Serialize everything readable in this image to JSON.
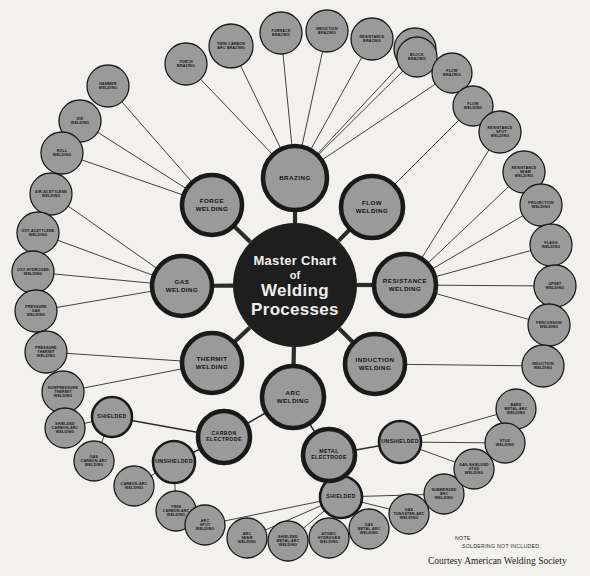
{
  "document": {
    "title_lines": [
      "Master Chart",
      "of",
      "Welding",
      "Processes"
    ],
    "note_label": "NOTE",
    "note_text": "SOLDERING NOT INCLUDED.",
    "courtesy": "Courtesy American Welding Society",
    "background_color": "#f2f1ee",
    "node_fill": "#9a9a9a",
    "node_stroke": "#1a1a1a",
    "center_fill": "#1e1e1e",
    "center_text_color": "#efefef"
  },
  "chart_data": {
    "type": "diagram",
    "layout": "radial hub-and-spoke",
    "center": "Master Chart of Welding Processes",
    "hubs": [
      {
        "id": "brazing",
        "label": "BRAZING",
        "x": 295,
        "y": 178,
        "r": 32,
        "leaves": [
          {
            "label": "TWIN CARBON ARC BRAZING",
            "x": 231,
            "y": 46,
            "r": 22
          },
          {
            "label": "FURNACE BRAZING",
            "x": 281,
            "y": 33,
            "r": 21
          },
          {
            "label": "INDUCTION BRAZING",
            "x": 327,
            "y": 31,
            "r": 21
          },
          {
            "label": "RESISTANCE BRAZING",
            "x": 372,
            "y": 39,
            "r": 21
          },
          {
            "label": "DIP BRAZING",
            "x": 415,
            "y": 49,
            "r": 21
          },
          {
            "label": "TORCH BRAZING",
            "x": 186,
            "y": 64,
            "r": 21
          },
          {
            "label": "BLOCK BRAZING",
            "x": 417,
            "y": 57,
            "r": 20
          },
          {
            "label": "FLOW BRAZING",
            "x": 452,
            "y": 73,
            "r": 20
          }
        ]
      },
      {
        "id": "forge",
        "label": "FORGE WELDING",
        "x": 212,
        "y": 205,
        "r": 30,
        "leaves": [
          {
            "label": "HAMMER WELDING",
            "x": 108,
            "y": 86,
            "r": 21
          },
          {
            "label": "DIE WELDING",
            "x": 80,
            "y": 121,
            "r": 21
          },
          {
            "label": "ROLL WELDING",
            "x": 62,
            "y": 153,
            "r": 21
          }
        ]
      },
      {
        "id": "gas",
        "label": "GAS WELDING",
        "x": 182,
        "y": 286,
        "r": 30,
        "leaves": [
          {
            "label": "AIR-ACETYLENE WELDING",
            "x": 51,
            "y": 194,
            "r": 21
          },
          {
            "label": "OXY-ACETYLENE WELDING",
            "x": 38,
            "y": 233,
            "r": 21
          },
          {
            "label": "OXY-HYDROGEN WELDING",
            "x": 33,
            "y": 272,
            "r": 21
          },
          {
            "label": "PRESSURE GAS WELDING",
            "x": 36,
            "y": 311,
            "r": 21
          }
        ]
      },
      {
        "id": "thermit",
        "label": "THERMIT WELDING",
        "x": 212,
        "y": 363,
        "r": 30,
        "leaves": [
          {
            "label": "PRESSURE THERMIT WELDING",
            "x": 46,
            "y": 352,
            "r": 21
          },
          {
            "label": "NONPRESSURE THERMIT WELDING",
            "x": 63,
            "y": 392,
            "r": 21
          }
        ]
      },
      {
        "id": "flow",
        "label": "FLOW WELDING",
        "x": 372,
        "y": 207,
        "r": 31,
        "leaves": [
          {
            "label": "FLOW WELDING",
            "x": 473,
            "y": 106,
            "r": 20
          }
        ]
      },
      {
        "id": "resistance",
        "label": "RESISTANCE WELDING",
        "x": 405,
        "y": 285,
        "r": 31,
        "leaves": [
          {
            "label": "RESISTANCE - SPOT WELDING",
            "x": 500,
            "y": 132,
            "r": 21
          },
          {
            "label": "RESISTANCE - SEAM WELDING",
            "x": 524,
            "y": 172,
            "r": 21
          },
          {
            "label": "PROJECTION WELDING",
            "x": 541,
            "y": 205,
            "r": 21
          },
          {
            "label": "FLASH WELDING",
            "x": 551,
            "y": 245,
            "r": 21
          },
          {
            "label": "UPSET WELDING",
            "x": 555,
            "y": 286,
            "r": 21
          },
          {
            "label": "PERCUSSION WELDING",
            "x": 549,
            "y": 325,
            "r": 21
          }
        ]
      },
      {
        "id": "induction",
        "label": "INDUCTION WELDING",
        "x": 375,
        "y": 364,
        "r": 30,
        "leaves": [
          {
            "label": "INDUCTION WELDING",
            "x": 543,
            "y": 366,
            "r": 21
          }
        ]
      },
      {
        "id": "arc",
        "label": "ARC WELDING",
        "x": 293,
        "y": 397,
        "r": 31,
        "leaves": []
      }
    ],
    "arc_branch": {
      "sub_hubs": [
        {
          "id": "carbon-electrode",
          "label": "CARBON ELECTRODE",
          "x": 224,
          "y": 437,
          "r": 26
        },
        {
          "id": "metal-electrode",
          "label": "METAL ELECTRODE",
          "x": 329,
          "y": 455,
          "r": 26
        }
      ],
      "groups": [
        {
          "id": "carbon-shielded",
          "label": "SHIELDED",
          "x": 112,
          "y": 417,
          "r": 20,
          "parent": "carbon-electrode",
          "leaves": [
            {
              "label": "SHIELDED CARBON-ARC WELDING",
              "x": 65,
              "y": 428,
              "r": 20
            },
            {
              "label": "GAS CARBON-ARC WELDING",
              "x": 94,
              "y": 461,
              "r": 20
            }
          ]
        },
        {
          "id": "carbon-unshielded",
          "label": "UNSHIELDED",
          "x": 174,
          "y": 462,
          "r": 21,
          "parent": "carbon-electrode",
          "leaves": [
            {
              "label": "CARBON-ARC WELDING",
              "x": 134,
              "y": 486,
              "r": 20
            },
            {
              "label": "TWIN CARBON-ARC WELDING",
              "x": 176,
              "y": 511,
              "r": 20
            }
          ]
        },
        {
          "id": "metal-shielded",
          "label": "SHIELDED",
          "x": 341,
          "y": 497,
          "r": 21,
          "parent": "metal-electrode",
          "leaves": [
            {
              "label": "ARC SPOT WELDING",
              "x": 205,
              "y": 525,
              "r": 20
            },
            {
              "label": "ARC SEAM WELDING",
              "x": 247,
              "y": 538,
              "r": 20
            },
            {
              "label": "SHIELDED METAL-ARC WELDING",
              "x": 288,
              "y": 541,
              "r": 20
            },
            {
              "label": "ATOMIC HYDROGEN WELDING",
              "x": 329,
              "y": 538,
              "r": 20
            },
            {
              "label": "GAS METAL-ARC WELDING",
              "x": 369,
              "y": 529,
              "r": 20
            },
            {
              "label": "GAS TUNGSTEN-ARC WELDING",
              "x": 409,
              "y": 514,
              "r": 20
            },
            {
              "label": "SUBMERGED ARC WELDING",
              "x": 444,
              "y": 494,
              "r": 20
            }
          ]
        },
        {
          "id": "metal-unshielded",
          "label": "UNSHIELDED",
          "x": 400,
          "y": 442,
          "r": 21,
          "parent": "metal-electrode",
          "leaves": [
            {
              "label": "BARE METAL-ARC WELDING",
              "x": 516,
              "y": 409,
              "r": 20
            },
            {
              "label": "STUD WELDING",
              "x": 505,
              "y": 443,
              "r": 20
            },
            {
              "label": "GAS-SHIELDED STUD WELDING",
              "x": 474,
              "y": 469,
              "r": 20
            }
          ]
        }
      ]
    }
  }
}
